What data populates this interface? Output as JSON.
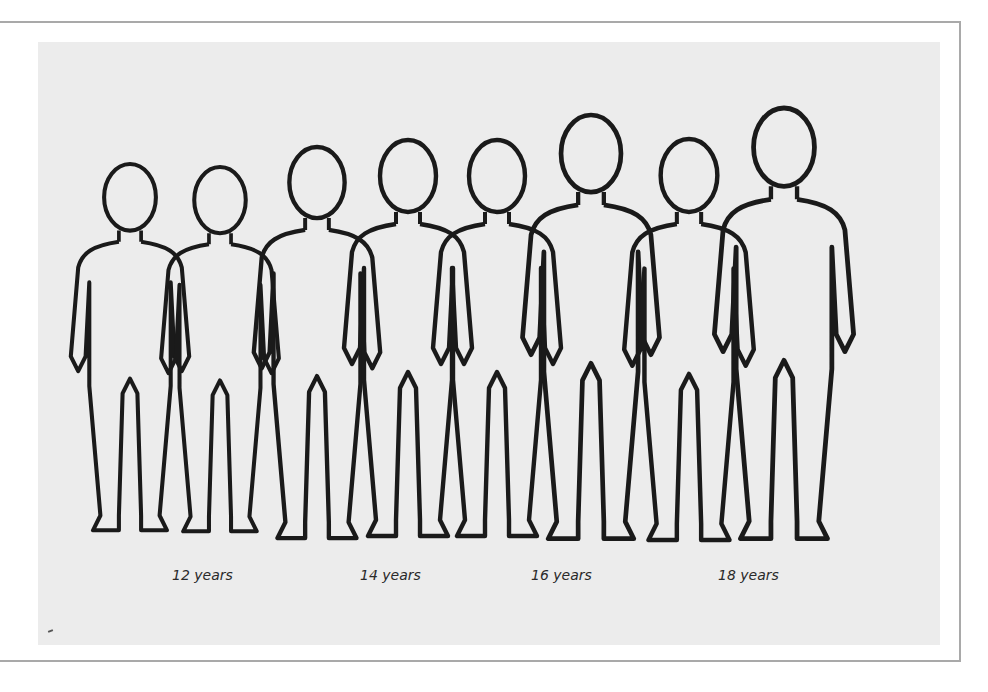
{
  "figure": {
    "age_labels": [
      {
        "label": "12 years",
        "x": 134
      },
      {
        "label": "14 years",
        "x": 322
      },
      {
        "label": "16 years",
        "x": 493
      },
      {
        "label": "18 years",
        "x": 680
      }
    ],
    "figures": [
      {
        "pair": 1,
        "position": "left",
        "age": "12 years",
        "height_px": 370
      },
      {
        "pair": 1,
        "position": "right",
        "age": "12 years",
        "height_px": 370
      },
      {
        "pair": 2,
        "position": "left",
        "age": "14 years",
        "height_px": 395
      },
      {
        "pair": 2,
        "position": "right",
        "age": "14 years",
        "height_px": 400
      },
      {
        "pair": 3,
        "position": "left",
        "age": "16 years",
        "height_px": 400
      },
      {
        "pair": 3,
        "position": "right",
        "age": "16 years",
        "height_px": 428
      },
      {
        "pair": 4,
        "position": "left",
        "age": "18 years",
        "height_px": 405
      },
      {
        "pair": 4,
        "position": "right",
        "age": "18 years",
        "height_px": 435
      }
    ],
    "colors": {
      "panel_background": "#ececec",
      "line": "#1a1a1a",
      "frame": "#a9a9a9"
    }
  }
}
